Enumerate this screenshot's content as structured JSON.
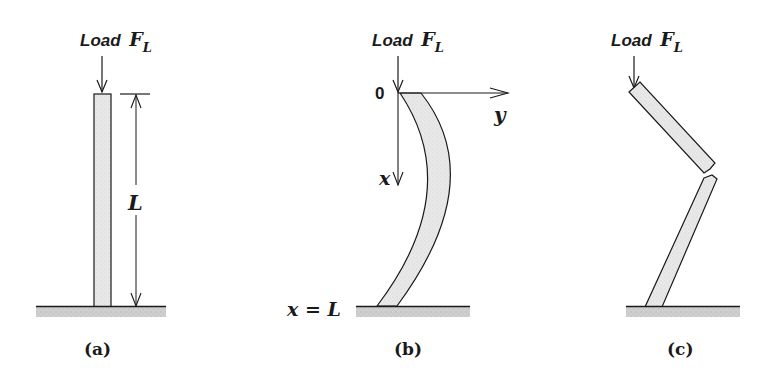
{
  "figure": {
    "panels": [
      {
        "id": "a",
        "caption": "(a)",
        "load_label": "Load",
        "force_symbol": "F",
        "force_subscript": "L",
        "length_label": "L",
        "description": "straight upright column under axial load with length dimension L"
      },
      {
        "id": "b",
        "caption": "(b)",
        "load_label": "Load",
        "force_symbol": "F",
        "force_subscript": "L",
        "origin_label": "0",
        "x_axis_label": "x",
        "y_axis_label": "y",
        "base_label": "x = L",
        "description": "column buckled into a curve with x-y coordinate axes at top"
      },
      {
        "id": "c",
        "caption": "(c)",
        "load_label": "Load",
        "force_symbol": "F",
        "force_subscript": "L",
        "description": "column broken into two segments at a kink"
      }
    ],
    "colors": {
      "line": "#1a1a1a",
      "fill": "#e6e6e6",
      "ground": "#c8c8c8"
    }
  }
}
